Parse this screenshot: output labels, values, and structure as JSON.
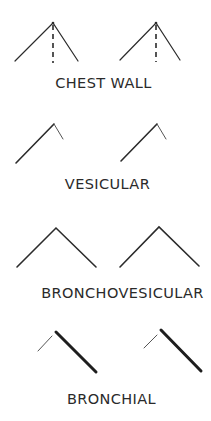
{
  "diagram": {
    "colors": {
      "line": "#2b2b2b",
      "text": "#2a2a2a",
      "background": "#ffffff"
    },
    "sections": [
      {
        "id": "chest-wall",
        "label": "CHEST WALL",
        "description": "Inspiration upstroke and expiration downstroke of equal length, with dashed vertical line at apex",
        "figures": 2
      },
      {
        "id": "vesicular",
        "label": "VESICULAR",
        "description": "Long inspiration upstroke followed by short, faint expiration",
        "figures": 2
      },
      {
        "id": "bronchovesicular",
        "label": "BRONCHOVESICULAR",
        "description": "Inspiration and expiration of equal length and intensity",
        "figures": 2
      },
      {
        "id": "bronchial",
        "label": "BRONCHIAL",
        "description": "Short thin inspiration, pause, long thick loud expiration",
        "figures": 2
      }
    ]
  }
}
